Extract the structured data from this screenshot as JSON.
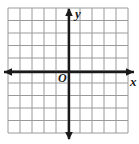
{
  "figure": {
    "background_color": "#ffffff",
    "width": 139,
    "height": 144
  },
  "grid": {
    "line_color": "#9a9a9a",
    "line_width": 1,
    "left": 8,
    "top": 8,
    "right": 128,
    "bottom": 133,
    "columns": 10,
    "rows": 10,
    "cell_width": 12,
    "cell_height": 12.5
  },
  "axes": {
    "color": "#1a1a1a",
    "line_width": 2.4,
    "x_axis": {
      "label": "x",
      "position_y": 72,
      "start_x": 4,
      "end_x": 134,
      "arrow_left": true,
      "arrow_right": true
    },
    "y_axis": {
      "label": "y",
      "position_x": 69,
      "start_y": 9,
      "end_y": 139,
      "arrow_up": true,
      "arrow_down": true
    },
    "origin": {
      "label": "O",
      "x": 69,
      "y": 72
    }
  },
  "chart_data": {
    "type": "scatter",
    "title": "",
    "subtitle": "",
    "xlabel": "x",
    "ylabel": "y",
    "series": [
      {
        "name": "",
        "x": [],
        "y": []
      }
    ],
    "x": [],
    "values": [],
    "categories": [],
    "xlim": [
      -5,
      5
    ],
    "ylim": [
      -5,
      5
    ],
    "xticks": [
      -5,
      -4,
      -3,
      -2,
      -1,
      0,
      1,
      2,
      3,
      4,
      5
    ],
    "yticks": [
      -5,
      -4,
      -3,
      -2,
      -1,
      0,
      1,
      2,
      3,
      4,
      5
    ],
    "tick_labels_visible": false,
    "grid": true,
    "legend": null,
    "annotations": [
      {
        "text": "O",
        "x": 0,
        "y": 0,
        "role": "origin-label"
      },
      {
        "text": "x",
        "x": 5,
        "y": 0,
        "role": "x-axis-label"
      },
      {
        "text": "y",
        "x": 0,
        "y": 5,
        "role": "y-axis-label"
      }
    ]
  }
}
